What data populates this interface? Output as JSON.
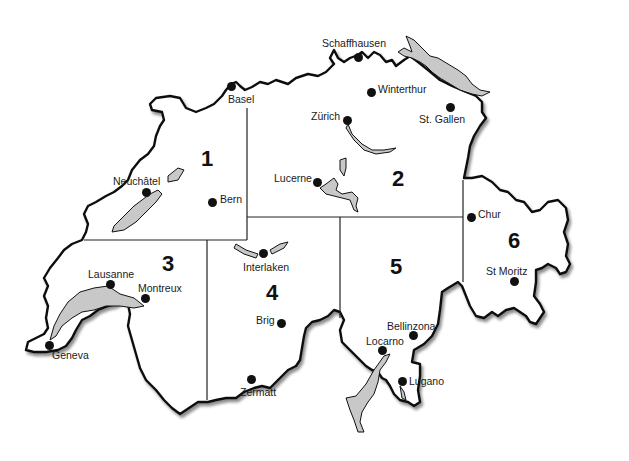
{
  "map": {
    "title": "Switzerland regions",
    "colors": {
      "border": "#111111",
      "lake": "#c8c8c8",
      "shadow": "#9a9a9a",
      "background": "#ffffff"
    },
    "regions": [
      {
        "number": "1",
        "x": 201,
        "y": 148
      },
      {
        "number": "2",
        "x": 392,
        "y": 168
      },
      {
        "number": "3",
        "x": 162,
        "y": 253
      },
      {
        "number": "4",
        "x": 266,
        "y": 282
      },
      {
        "number": "5",
        "x": 390,
        "y": 256
      },
      {
        "number": "6",
        "x": 508,
        "y": 230
      }
    ],
    "cities": [
      {
        "name": "Basel",
        "dot": [
          231,
          86
        ],
        "label": [
          228,
          94
        ]
      },
      {
        "name": "Schaffhausen",
        "dot": [
          358,
          57
        ],
        "label": [
          322,
          38
        ]
      },
      {
        "name": "Winterthur",
        "dot": [
          371,
          92
        ],
        "label": [
          378,
          84
        ]
      },
      {
        "name": "Zürich",
        "dot": [
          347,
          120
        ],
        "label": [
          311,
          111
        ]
      },
      {
        "name": "St. Gallen",
        "dot": [
          450,
          107
        ],
        "label": [
          419,
          114
        ]
      },
      {
        "name": "Neuchâtel",
        "dot": [
          146,
          192
        ],
        "label": [
          113,
          176
        ]
      },
      {
        "name": "Bern",
        "dot": [
          212,
          202
        ],
        "label": [
          220,
          194
        ]
      },
      {
        "name": "Lucerne",
        "dot": [
          317,
          182
        ],
        "label": [
          274,
          173
        ]
      },
      {
        "name": "Chur",
        "dot": [
          471,
          217
        ],
        "label": [
          478,
          209
        ]
      },
      {
        "name": "Interlaken",
        "dot": [
          263,
          253
        ],
        "label": [
          243,
          262
        ]
      },
      {
        "name": "Lausanne",
        "dot": [
          110,
          284
        ],
        "label": [
          88,
          269
        ]
      },
      {
        "name": "Montreux",
        "dot": [
          145,
          298
        ],
        "label": [
          138,
          283
        ]
      },
      {
        "name": "St Moritz",
        "dot": [
          514,
          281
        ],
        "label": [
          486,
          266
        ]
      },
      {
        "name": "Brig",
        "dot": [
          281,
          323
        ],
        "label": [
          256,
          315
        ]
      },
      {
        "name": "Geneva",
        "dot": [
          49,
          345
        ],
        "label": [
          52,
          350
        ]
      },
      {
        "name": "Bellinzona",
        "dot": [
          413,
          335
        ],
        "label": [
          387,
          321
        ]
      },
      {
        "name": "Locarno",
        "dot": [
          382,
          350
        ],
        "label": [
          366,
          336
        ]
      },
      {
        "name": "Lugano",
        "dot": [
          402,
          381
        ],
        "label": [
          409,
          376
        ]
      },
      {
        "name": "Zermatt",
        "dot": [
          251,
          379
        ],
        "label": [
          240,
          387
        ]
      }
    ]
  }
}
